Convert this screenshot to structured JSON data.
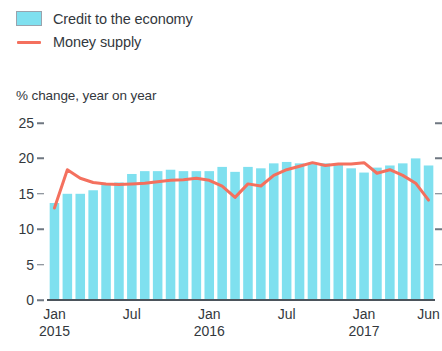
{
  "legend": {
    "items": [
      {
        "label": "Credit to the economy",
        "type": "bar",
        "color": "#7fe0ef"
      },
      {
        "label": "Money supply",
        "type": "line",
        "color": "#f4705e"
      }
    ]
  },
  "axis_title": "% change, year on year",
  "chart_data": {
    "type": "bar",
    "title": "",
    "subtitle": "",
    "xlabel": "",
    "ylabel": "% change, year on year",
    "ylim": [
      0,
      25
    ],
    "yticks": [
      0,
      5,
      10,
      15,
      20,
      25
    ],
    "ytick_labels": [
      "0",
      "5",
      "10",
      "15",
      "20",
      "25"
    ],
    "grid": false,
    "legend_position": "top-left",
    "categories": [
      "Jan 2015",
      "Feb 2015",
      "Mar 2015",
      "Apr 2015",
      "May 2015",
      "Jun 2015",
      "Jul 2015",
      "Aug 2015",
      "Sep 2015",
      "Oct 2015",
      "Nov 2015",
      "Dec 2015",
      "Jan 2016",
      "Feb 2016",
      "Mar 2016",
      "Apr 2016",
      "May 2016",
      "Jun 2016",
      "Jul 2016",
      "Aug 2016",
      "Sep 2016",
      "Oct 2016",
      "Nov 2016",
      "Dec 2016",
      "Jan 2017",
      "Feb 2017",
      "Mar 2017",
      "Apr 2017",
      "May 2017",
      "Jun 2017"
    ],
    "xtick_labels": [
      {
        "month": "Jan",
        "year": "2015",
        "index": 0
      },
      {
        "month": "Jul",
        "year": "",
        "index": 6
      },
      {
        "month": "Jan",
        "year": "2016",
        "index": 12
      },
      {
        "month": "Jul",
        "year": "",
        "index": 18
      },
      {
        "month": "Jan",
        "year": "2017",
        "index": 24
      },
      {
        "month": "Jun",
        "year": "",
        "index": 29
      }
    ],
    "series": [
      {
        "name": "Credit to the economy",
        "type": "bar",
        "color": "#7fe0ef",
        "values": [
          13.7,
          15.0,
          15.0,
          15.5,
          16.3,
          16.6,
          17.8,
          18.2,
          18.2,
          18.4,
          18.2,
          18.2,
          18.2,
          18.8,
          18.1,
          18.8,
          18.6,
          19.3,
          19.5,
          19.3,
          19.3,
          19.3,
          19.1,
          18.6,
          18.0,
          18.7,
          19.0,
          19.3,
          20.0,
          19.0
        ]
      },
      {
        "name": "Money supply",
        "type": "line",
        "color": "#f4705e",
        "values": [
          13.0,
          18.4,
          17.2,
          16.6,
          16.4,
          16.3,
          16.4,
          16.5,
          16.7,
          16.9,
          17.0,
          17.2,
          16.9,
          16.1,
          14.5,
          16.4,
          16.1,
          17.6,
          18.4,
          18.9,
          19.4,
          19.0,
          19.2,
          19.2,
          19.4,
          17.9,
          18.4,
          17.6,
          16.5,
          14.1
        ]
      }
    ]
  }
}
